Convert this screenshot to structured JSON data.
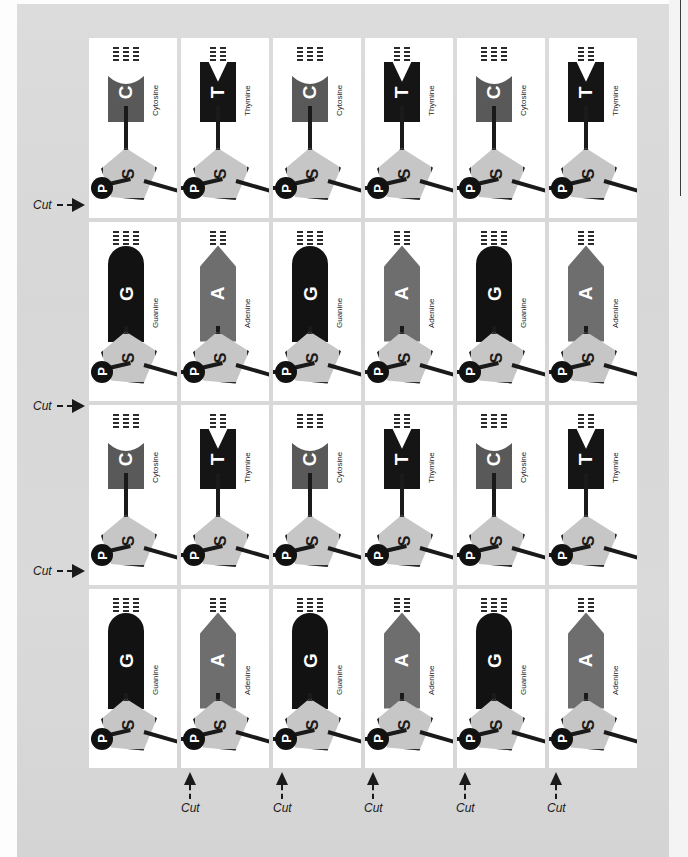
{
  "figure": {
    "background_color": "#d9d9d9",
    "card_color": "#ffffff"
  },
  "legend": {
    "sugar_letter": "S",
    "phosphate_letter": "P",
    "sugar_color": "#c6c6c6",
    "phosphate_color": "#111111"
  },
  "bases": {
    "C": {
      "letter": "C",
      "name": "Cytosine",
      "color": "#595959",
      "shape": "concave-top",
      "bond_groups": 3,
      "tall": false
    },
    "T": {
      "letter": "T",
      "name": "Thymine",
      "color": "#151515",
      "shape": "notched-top",
      "bond_groups": 2,
      "tall": false
    },
    "G": {
      "letter": "G",
      "name": "Guanine",
      "color": "#121212",
      "shape": "round-top",
      "bond_groups": 3,
      "tall": true
    },
    "A": {
      "letter": "A",
      "name": "Adenine",
      "color": "#6e6e6e",
      "shape": "point-top",
      "bond_groups": 2,
      "tall": true
    }
  },
  "grid": {
    "rows": 4,
    "cols": 6,
    "cells": [
      [
        "C",
        "T",
        "C",
        "T",
        "C",
        "T"
      ],
      [
        "G",
        "A",
        "G",
        "A",
        "G",
        "A"
      ],
      [
        "C",
        "T",
        "C",
        "T",
        "C",
        "T"
      ],
      [
        "G",
        "A",
        "G",
        "A",
        "G",
        "A"
      ]
    ]
  },
  "cut_markers": {
    "label": "Cut",
    "left": [
      {
        "label": "Cut",
        "top": 198
      },
      {
        "label": "Cut",
        "top": 399
      },
      {
        "label": "Cut",
        "top": 564
      }
    ],
    "bottom": [
      {
        "label": "Cut",
        "left": 181
      },
      {
        "label": "Cut",
        "left": 273
      },
      {
        "label": "Cut",
        "left": 364
      },
      {
        "label": "Cut",
        "left": 456
      },
      {
        "label": "Cut",
        "left": 547
      }
    ]
  }
}
